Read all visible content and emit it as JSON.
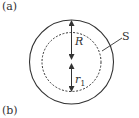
{
  "labels": {
    "panel_a": "(a)",
    "panel_b": "(b)",
    "radius_outer": "R",
    "radius_inner": "r",
    "radius_inner_sub": "1",
    "surface": "S"
  },
  "colors": {
    "stroke": "#333333"
  }
}
